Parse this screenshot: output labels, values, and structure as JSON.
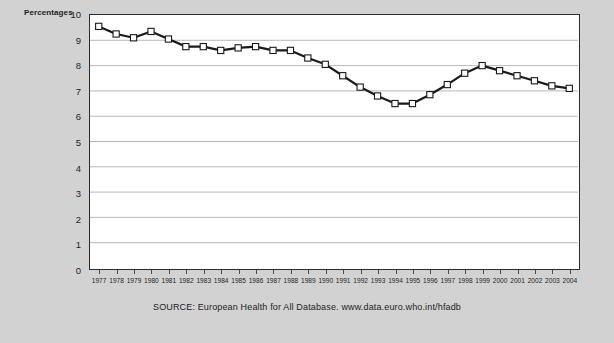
{
  "chart_data": {
    "type": "line",
    "title": "",
    "xlabel": "",
    "ylabel": "Percentages",
    "ylim": [
      0,
      10
    ],
    "yticks": [
      0,
      1,
      2,
      3,
      4,
      5,
      6,
      7,
      8,
      9,
      10
    ],
    "grid": true,
    "legend": null,
    "marker": "square",
    "line_color": "#1a1a1a",
    "marker_face_color": "#ffffff",
    "marker_edge_color": "#1a1a1a",
    "categories": [
      "1977",
      "1978",
      "1979",
      "1980",
      "1981",
      "1982",
      "1983",
      "1984",
      "1985",
      "1986",
      "1987",
      "1988",
      "1989",
      "1990",
      "1991",
      "1992",
      "1993",
      "1994",
      "1995",
      "1996",
      "1997",
      "1998",
      "1999",
      "2000",
      "2001",
      "2002",
      "2003",
      "2004"
    ],
    "values": [
      9.55,
      9.25,
      9.1,
      9.35,
      9.05,
      8.75,
      8.75,
      8.6,
      8.7,
      8.75,
      8.6,
      8.6,
      8.3,
      8.05,
      7.6,
      7.15,
      6.8,
      6.5,
      6.5,
      6.85,
      7.25,
      7.7,
      8.0,
      7.8,
      7.6,
      7.4,
      7.2,
      7.1
    ]
  },
  "axis": {
    "y_label": "Percentages",
    "y_ticks": [
      "10",
      "9",
      "8",
      "7",
      "6",
      "5",
      "4",
      "3",
      "2",
      "1",
      "0"
    ],
    "x_ticks": [
      "1977",
      "1978",
      "1979",
      "1980",
      "1981",
      "1982",
      "1983",
      "1984",
      "1985",
      "1986",
      "1987",
      "1988",
      "1989",
      "1990",
      "1991",
      "1992",
      "1993",
      "1994",
      "1995",
      "1996",
      "1997",
      "1998",
      "1999",
      "2000",
      "2001",
      "2002",
      "2003",
      "2004"
    ]
  },
  "footer": {
    "source": "SOURCE: European Health for All Database. www.data.euro.who.int/hfadb"
  },
  "colors": {
    "background": "#d2d2d2",
    "plot_background": "#ffffff",
    "axis": "#2b2b2b",
    "gridline": "#b9b9b9",
    "line": "#1a1a1a",
    "text": "#1d1d1d"
  }
}
